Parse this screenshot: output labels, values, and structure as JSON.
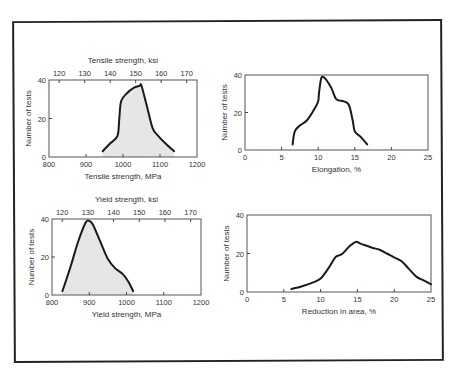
{
  "chart_data": [
    {
      "id": "tensile",
      "type": "area",
      "shaded": true,
      "title": "",
      "xlabel": "Tensile strength, MPa",
      "x2label": "Tensile strength, ksi",
      "ylabel": "Number of tests",
      "xlim": [
        800,
        1200
      ],
      "ylim": [
        0,
        40
      ],
      "xticks": [
        800,
        900,
        1000,
        1100,
        1200
      ],
      "x2ticks": [
        120,
        130,
        140,
        150,
        160,
        170
      ],
      "x2_conversion_mpa_per_ksi": 6.895,
      "yticks": [
        0,
        20,
        40
      ],
      "series": [
        {
          "name": "Tensile strength distribution",
          "x": [
            945,
            965,
            985,
            990,
            995,
            1010,
            1030,
            1045,
            1050,
            1065,
            1080,
            1095,
            1115,
            1138
          ],
          "y": [
            3,
            7,
            11,
            20,
            29,
            33,
            36,
            37,
            37,
            26,
            15,
            11,
            7,
            3
          ]
        }
      ]
    },
    {
      "id": "elongation",
      "type": "line",
      "shaded": false,
      "title": "",
      "xlabel": "Elongation, %",
      "ylabel": "Number of tests",
      "xlim": [
        0,
        25
      ],
      "ylim": [
        0,
        40
      ],
      "xticks": [
        0,
        5,
        10,
        15,
        20,
        25
      ],
      "yticks": [
        0,
        20,
        40
      ],
      "series": [
        {
          "name": "Elongation distribution",
          "x": [
            6.5,
            6.8,
            7.5,
            8.5,
            9.5,
            10.0,
            10.1,
            10.3,
            10.5,
            11.0,
            11.8,
            12.5,
            13.5,
            14.2,
            14.7,
            15.0,
            15.8,
            16.7
          ],
          "y": [
            3,
            10,
            13,
            16,
            22,
            26,
            30,
            36,
            39,
            38,
            33,
            27,
            26,
            24,
            16,
            10,
            7,
            3
          ]
        }
      ]
    },
    {
      "id": "yield",
      "type": "area",
      "shaded": true,
      "title": "",
      "xlabel": "Yield strength, MPa",
      "x2label": "Yield strength, ksi",
      "ylabel": "Number of tests",
      "xlim": [
        800,
        1200
      ],
      "ylim": [
        0,
        40
      ],
      "xticks": [
        800,
        900,
        1000,
        1100,
        1200
      ],
      "x2ticks": [
        120,
        130,
        140,
        150,
        160,
        170
      ],
      "x2_conversion_mpa_per_ksi": 6.895,
      "yticks": [
        0,
        20,
        40
      ],
      "series": [
        {
          "name": "Yield strength distribution",
          "x": [
            828,
            850,
            870,
            890,
            900,
            910,
            930,
            950,
            970,
            990,
            1005,
            1018
          ],
          "y": [
            2,
            15,
            28,
            38,
            39,
            37,
            28,
            19,
            14,
            11,
            7,
            2
          ]
        }
      ]
    },
    {
      "id": "reduction",
      "type": "line",
      "shaded": false,
      "title": "",
      "xlabel": "Reduction in area, %",
      "ylabel": "Number of tests",
      "xlim": [
        0,
        25
      ],
      "ylim": [
        0,
        40
      ],
      "xticks": [
        0,
        5,
        10,
        15,
        20,
        25
      ],
      "yticks": [
        0,
        20,
        40
      ],
      "series": [
        {
          "name": "Reduction in area distribution",
          "x": [
            6,
            7.5,
            9,
            10,
            11,
            12,
            12.5,
            13,
            14,
            14.8,
            15.5,
            17,
            18,
            19,
            20,
            21,
            22,
            23,
            24,
            25
          ],
          "y": [
            1.5,
            3,
            5,
            7,
            12,
            18,
            19,
            20,
            24,
            26,
            25,
            23,
            22,
            20,
            18,
            16,
            12,
            8,
            6,
            4
          ]
        }
      ]
    }
  ]
}
